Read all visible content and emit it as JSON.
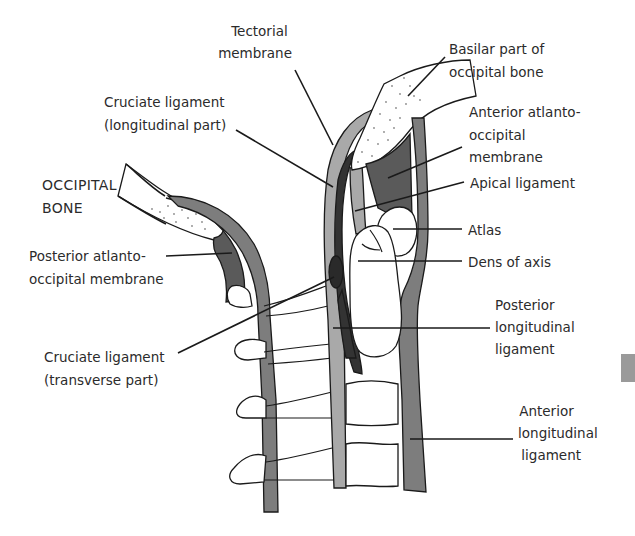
{
  "figure": {
    "colors": {
      "background": "#ffffff",
      "outline": "#1a1a1a",
      "light_ligament": "#a9a9a9",
      "medium_ligament": "#7d7d7d",
      "dark_ligament": "#474747",
      "darkest_ligament": "#2e2e2e",
      "bone_fill": "#ffffff",
      "stipple": "#8a8a8a",
      "label_text": "#2b2b2b"
    }
  },
  "labels": {
    "tectorial_membrane": {
      "lines": [
        "Tectorial",
        "membrane"
      ]
    },
    "basilar_part": {
      "lines": [
        "Basilar part of",
        "occipital bone"
      ]
    },
    "cruciate_longitudinal": {
      "lines": [
        "Cruciate ligament",
        "(longitudinal part)"
      ]
    },
    "anterior_atlanto_occipital": {
      "lines": [
        "Anterior atlanto-",
        "occipital",
        "membrane"
      ]
    },
    "occipital_bone": {
      "lines": [
        "OCCIPITAL",
        "BONE"
      ]
    },
    "apical_ligament": {
      "lines": [
        "Apical ligament"
      ]
    },
    "atlas": {
      "lines": [
        "Atlas"
      ]
    },
    "posterior_atlanto_occipital": {
      "lines": [
        "Posterior atlanto-",
        "occipital membrane"
      ]
    },
    "dens_of_axis": {
      "lines": [
        "Dens of axis"
      ]
    },
    "posterior_longitudinal": {
      "lines": [
        "Posterior",
        "longitudinal",
        "ligament"
      ]
    },
    "cruciate_transverse": {
      "lines": [
        "Cruciate ligament",
        "(transverse part)"
      ]
    },
    "anterior_longitudinal": {
      "lines": [
        "Anterior",
        "longitudinal",
        "ligament"
      ]
    }
  }
}
